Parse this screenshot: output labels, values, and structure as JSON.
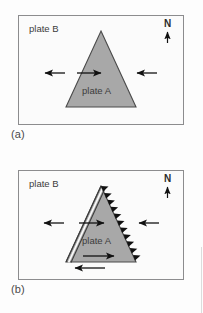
{
  "figure": {
    "type": "plate-tectonics-diagram",
    "background_color": "#fdfdfd",
    "frame_color": "#8c8c8e",
    "plate_fill_color": "#a8a8a8",
    "plate_outline_color": "#4a4a4a",
    "arrow_color": "#111111"
  },
  "panels": [
    {
      "id": "a",
      "caption": "(a)",
      "plate_b_label": "plate B",
      "plate_a_label": "plate A",
      "compass_label": "N",
      "compass_direction": "up",
      "boundaries": {
        "left_edge": "plain-line",
        "right_edge": "plain-line",
        "bottom_edge": "plain-line"
      },
      "arrows": [
        {
          "name": "left-outside-arrow",
          "direction": "left"
        },
        {
          "name": "interior-right-arrow",
          "direction": "right"
        },
        {
          "name": "right-outside-arrow",
          "direction": "left"
        }
      ]
    },
    {
      "id": "b",
      "caption": "(b)",
      "plate_b_label": "plate B",
      "plate_a_label": "plate A",
      "compass_label": "N",
      "compass_direction": "up",
      "boundaries": {
        "left_edge": "double-line-ridge",
        "right_edge": "barbed-subduction-teeth",
        "bottom_edge": "strike-slip-couple"
      },
      "arrows": [
        {
          "name": "left-outside-arrow",
          "direction": "left"
        },
        {
          "name": "interior-right-arrow",
          "direction": "right"
        },
        {
          "name": "right-outside-arrow",
          "direction": "left"
        },
        {
          "name": "strike-slip-upper-arrow",
          "direction": "right"
        },
        {
          "name": "strike-slip-lower-arrow",
          "direction": "left"
        }
      ],
      "teeth_count": 11
    }
  ]
}
